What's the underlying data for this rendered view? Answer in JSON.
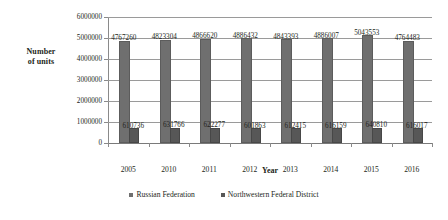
{
  "chart_data": {
    "type": "bar",
    "title": "",
    "xlabel": "Year",
    "ylabel": "Number of units",
    "ylabel_lines": [
      "Number",
      "of units"
    ],
    "categories": [
      "2005",
      "2010",
      "2011",
      "2012",
      "2013",
      "2014",
      "2015",
      "2016"
    ],
    "ylim": [
      0,
      6000000
    ],
    "ytick_labels": [
      "0",
      "1000000",
      "2000000",
      "3000000",
      "4000000",
      "5000000",
      "6000000"
    ],
    "ytick_values": [
      0,
      1000000,
      2000000,
      3000000,
      4000000,
      5000000,
      6000000
    ],
    "grid": true,
    "legend_position": "bottom",
    "series": [
      {
        "name": "Russian Federation",
        "color": "#6f6f6f",
        "values": [
          4767260,
          4823304,
          4866620,
          4886432,
          4843393,
          4886007,
          5043553,
          4764483
        ],
        "labels": [
          "4767260",
          "4823304",
          "4866620",
          "4886432",
          "4843393",
          "4886007",
          "5043553",
          "4764483"
        ]
      },
      {
        "name": "Northwestern Federal District",
        "color": "#575757",
        "values": [
          610736,
          631766,
          622277,
          601863,
          612415,
          616159,
          640810,
          616017
        ],
        "labels": [
          "610736",
          "631766",
          "622277",
          "601863",
          "612415",
          "616159",
          "640810",
          "616017"
        ]
      }
    ]
  }
}
